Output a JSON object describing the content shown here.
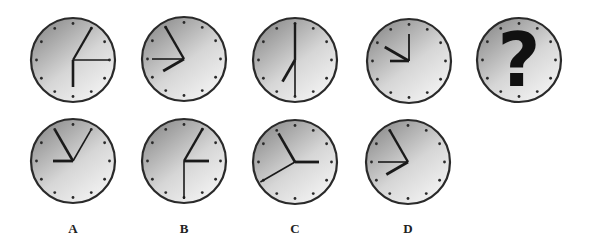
{
  "puzzle": {
    "colors": {
      "face_light": "#f4f4f4",
      "face_dark": "#8e8e8e",
      "rim": "#2a2a2a",
      "hand": "#1a1a1a",
      "tick": "#2a2a2a",
      "qmark": "#111111"
    },
    "radius": 42,
    "sequence": [
      {
        "id": "seq-1",
        "cx": 73,
        "cy": 60,
        "hands": [
          {
            "angle": 30,
            "length": 38,
            "width": 2.2
          },
          {
            "angle": 90,
            "length": 36,
            "width": 1.6
          },
          {
            "angle": 180,
            "length": 27,
            "width": 2.6
          }
        ]
      },
      {
        "id": "seq-2",
        "cx": 184,
        "cy": 59,
        "hands": [
          {
            "angle": 330,
            "length": 38,
            "width": 2.4
          },
          {
            "angle": 270,
            "length": 32,
            "width": 1.6
          },
          {
            "angle": 240,
            "length": 24,
            "width": 2.8
          }
        ]
      },
      {
        "id": "seq-3",
        "cx": 295,
        "cy": 60,
        "hands": [
          {
            "angle": 0,
            "length": 37,
            "width": 2.4
          },
          {
            "angle": 180,
            "length": 36,
            "width": 1.6
          },
          {
            "angle": 210,
            "length": 25,
            "width": 2.8
          }
        ]
      },
      {
        "id": "seq-4",
        "cx": 409,
        "cy": 61,
        "hands": [
          {
            "angle": 0,
            "length": 27,
            "width": 1.8
          },
          {
            "angle": 300,
            "length": 28,
            "width": 2.8
          },
          {
            "angle": 270,
            "length": 19,
            "width": 2.6
          }
        ]
      },
      {
        "id": "seq-5-unknown",
        "cx": 519,
        "cy": 60,
        "hands": [],
        "question_mark": "?"
      }
    ],
    "options": [
      {
        "label": "A",
        "cx": 73,
        "cy": 161,
        "label_y": 221,
        "hands": [
          {
            "angle": 330,
            "length": 36,
            "width": 2.6
          },
          {
            "angle": 30,
            "length": 36,
            "width": 1.6
          },
          {
            "angle": 270,
            "length": 20,
            "width": 2.8
          }
        ]
      },
      {
        "label": "B",
        "cx": 184,
        "cy": 161,
        "label_y": 221,
        "hands": [
          {
            "angle": 30,
            "length": 38,
            "width": 2.4
          },
          {
            "angle": 90,
            "length": 25,
            "width": 2.8
          },
          {
            "angle": 180,
            "length": 38,
            "width": 1.6
          }
        ]
      },
      {
        "label": "C",
        "cx": 295,
        "cy": 162,
        "label_y": 221,
        "hands": [
          {
            "angle": 330,
            "length": 33,
            "width": 2.6
          },
          {
            "angle": 90,
            "length": 24,
            "width": 2.8
          },
          {
            "angle": 240,
            "length": 40,
            "width": 1.6
          }
        ]
      },
      {
        "label": "D",
        "cx": 408,
        "cy": 162,
        "label_y": 221,
        "hands": [
          {
            "angle": 330,
            "length": 37,
            "width": 2.4
          },
          {
            "angle": 270,
            "length": 30,
            "width": 1.6
          },
          {
            "angle": 240,
            "length": 25,
            "width": 2.8
          }
        ]
      }
    ]
  }
}
